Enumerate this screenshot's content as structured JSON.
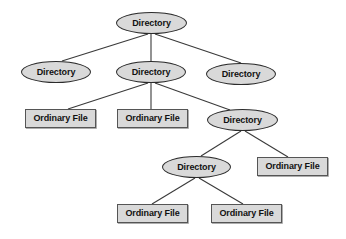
{
  "diagram": {
    "type": "tree-diagram",
    "canvas": {
      "width": 346,
      "height": 239
    },
    "style": {
      "background_color": "#ffffff",
      "node_fill_color": "#d9d9d9",
      "directory_stroke_color": "#2b2b2b",
      "file_stroke_color": "#555555",
      "edge_color": "#3a3a3a",
      "text_color": "#111111"
    },
    "labels": {
      "directory": "Directory",
      "ordinary_file": "Ordinary File"
    },
    "nodes": [
      {
        "id": "n1",
        "label": "Directory",
        "shape": "ellipse",
        "x": 116,
        "y": 12,
        "w": 71,
        "h": 22
      },
      {
        "id": "n2",
        "label": "Directory",
        "shape": "ellipse",
        "x": 21,
        "y": 61,
        "w": 70,
        "h": 22
      },
      {
        "id": "n3",
        "label": "Directory",
        "shape": "ellipse",
        "x": 116,
        "y": 61,
        "w": 70,
        "h": 22
      },
      {
        "id": "n4",
        "label": "Directory",
        "shape": "ellipse",
        "x": 206,
        "y": 63,
        "w": 70,
        "h": 22
      },
      {
        "id": "n5",
        "label": "Ordinary File",
        "shape": "rect",
        "x": 25,
        "y": 109,
        "w": 71,
        "h": 19
      },
      {
        "id": "n6",
        "label": "Ordinary File",
        "shape": "rect",
        "x": 117,
        "y": 109,
        "w": 71,
        "h": 19
      },
      {
        "id": "n7",
        "label": "Directory",
        "shape": "ellipse",
        "x": 207,
        "y": 109,
        "w": 71,
        "h": 22
      },
      {
        "id": "n8",
        "label": "Directory",
        "shape": "ellipse",
        "x": 162,
        "y": 156,
        "w": 69,
        "h": 22
      },
      {
        "id": "n9",
        "label": "Ordinary File",
        "shape": "rect",
        "x": 257,
        "y": 157,
        "w": 71,
        "h": 19
      },
      {
        "id": "n10",
        "label": "Ordinary File",
        "shape": "rect",
        "x": 117,
        "y": 204,
        "w": 71,
        "h": 19
      },
      {
        "id": "n11",
        "label": "Ordinary File",
        "shape": "rect",
        "x": 211,
        "y": 204,
        "w": 71,
        "h": 19
      }
    ],
    "edges": [
      {
        "from": "n1",
        "to": "n2",
        "x1": 148,
        "y1": 34,
        "x2": 62,
        "y2": 61
      },
      {
        "from": "n1",
        "to": "n3",
        "x1": 151,
        "y1": 34,
        "x2": 151,
        "y2": 61
      },
      {
        "from": "n1",
        "to": "n4",
        "x1": 155,
        "y1": 34,
        "x2": 241,
        "y2": 63
      },
      {
        "from": "n3",
        "to": "n5",
        "x1": 148,
        "y1": 83,
        "x2": 68,
        "y2": 109
      },
      {
        "from": "n3",
        "to": "n6",
        "x1": 151,
        "y1": 83,
        "x2": 151,
        "y2": 109
      },
      {
        "from": "n3",
        "to": "n7",
        "x1": 155,
        "y1": 83,
        "x2": 230,
        "y2": 110
      },
      {
        "from": "n7",
        "to": "n8",
        "x1": 241,
        "y1": 131,
        "x2": 201,
        "y2": 156
      },
      {
        "from": "n7",
        "to": "n9",
        "x1": 245,
        "y1": 131,
        "x2": 288,
        "y2": 157
      },
      {
        "from": "n8",
        "to": "n10",
        "x1": 195,
        "y1": 178,
        "x2": 152,
        "y2": 204
      },
      {
        "from": "n8",
        "to": "n11",
        "x1": 199,
        "y1": 178,
        "x2": 243,
        "y2": 204
      }
    ]
  }
}
